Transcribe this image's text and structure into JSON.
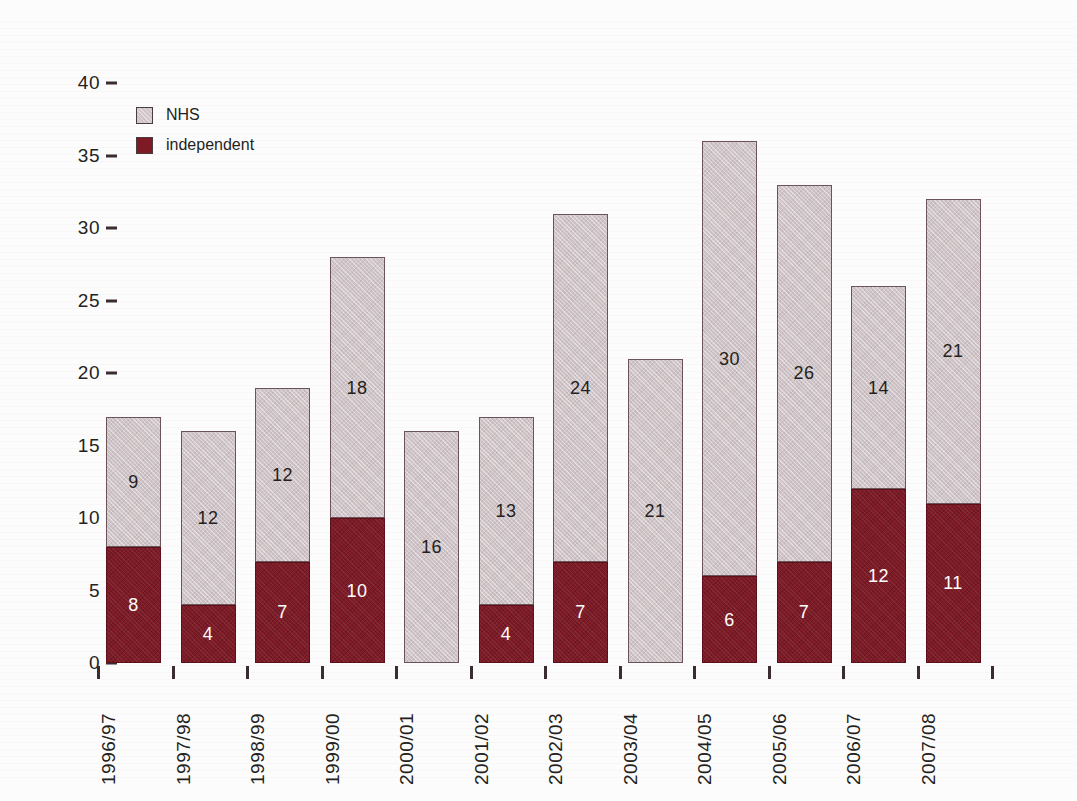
{
  "chart_data": {
    "type": "bar",
    "stacked": true,
    "title": "",
    "subtitle": "",
    "xlabel": "",
    "ylabel": "",
    "ylim": [
      0,
      40
    ],
    "yticks": [
      0,
      5,
      10,
      15,
      20,
      25,
      30,
      35,
      40
    ],
    "grid": false,
    "legend_position": "top-left",
    "categories": [
      "1996/97",
      "1997/98",
      "1998/99",
      "1999/00",
      "2000/01",
      "2001/02",
      "2002/03",
      "2003/04",
      "2004/05",
      "2005/06",
      "2006/07",
      "2007/08"
    ],
    "series": [
      {
        "name": "independent",
        "color": "#7d1a26",
        "values": [
          8,
          4,
          7,
          10,
          0,
          4,
          7,
          0,
          6,
          7,
          12,
          11
        ]
      },
      {
        "name": "NHS",
        "color": "#cfc4c7",
        "values": [
          9,
          12,
          12,
          18,
          16,
          13,
          24,
          21,
          30,
          26,
          14,
          21
        ]
      }
    ],
    "totals": [
      17,
      16,
      19,
      28,
      16,
      17,
      31,
      21,
      36,
      33,
      26,
      32
    ],
    "bar_labels": {
      "independent": [
        "8",
        "4",
        "7",
        "10",
        "",
        "4",
        "7",
        "",
        "6",
        "7",
        "12",
        "11"
      ],
      "NHS": [
        "9",
        "12",
        "12",
        "18",
        "16",
        "13",
        "24",
        "21",
        "30",
        "26",
        "14",
        "21"
      ]
    }
  },
  "legend": {
    "items": [
      {
        "label": "NHS",
        "color": "#cfc4c7"
      },
      {
        "label": "independent",
        "color": "#7d1a26"
      }
    ]
  },
  "colors": {
    "independent": "#7d1a26",
    "nhs": "#cfc4c7",
    "text": "#241f20",
    "axis": "#3b2c30",
    "background": "#fdfcfc"
  }
}
